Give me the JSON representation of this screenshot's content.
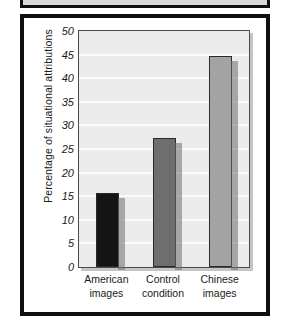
{
  "chart_data": {
    "type": "bar",
    "title": "",
    "subtitle": "",
    "xlabel": "",
    "ylabel": "Percentage of situational attributions",
    "categories": [
      "American images",
      "Control condition",
      "Chinese images"
    ],
    "category_lines": [
      [
        "American",
        "images"
      ],
      [
        "Control",
        "condition"
      ],
      [
        "Chinese",
        "images"
      ]
    ],
    "values": [
      15.7,
      27.3,
      44.8
    ],
    "ylim": [
      0,
      50
    ],
    "ytick_step": 5,
    "yticks": [
      0,
      5,
      10,
      15,
      20,
      25,
      30,
      35,
      40,
      45,
      50
    ],
    "ytick_labels": [
      "0",
      "5",
      "10",
      "15",
      "20",
      "25",
      "30",
      "35",
      "40",
      "45",
      "50"
    ],
    "grid": true,
    "legend": false,
    "legend_position": "none",
    "bar_colors": [
      "#141414",
      "#6e6e6e",
      "#a3a3a3"
    ],
    "gridline_color": "#fbfbfb",
    "plot_background": "#ebebeb",
    "frame_color": "#101010",
    "page_background": "#ffffff"
  }
}
